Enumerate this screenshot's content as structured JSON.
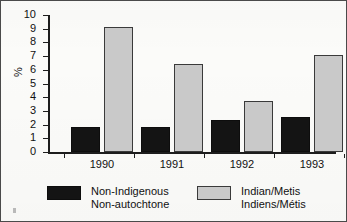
{
  "chart_data": {
    "type": "bar",
    "title": "",
    "xlabel": "",
    "ylabel": "%",
    "ylim": [
      0,
      10
    ],
    "ytick_step": 1,
    "grid": false,
    "legend_position": "bottom",
    "categories": [
      "1990",
      "1991",
      "1992",
      "1993"
    ],
    "ytick_labels": [
      "10",
      "9",
      "8",
      "7",
      "6",
      "5",
      "4",
      "3",
      "2",
      "1",
      "0"
    ],
    "series": [
      {
        "name": "Non-Indigenous",
        "name_fr": "Non-autochtone",
        "color": "#141414",
        "values": [
          1.8,
          1.85,
          2.35,
          2.55
        ]
      },
      {
        "name": "Indian/Metis",
        "name_fr": "Indiens/Métis",
        "color": "#c9c9c9",
        "values": [
          9.1,
          6.4,
          3.75,
          7.1
        ]
      }
    ]
  },
  "legend": {
    "entries": [
      {
        "line1": "Non-Indigenous",
        "line2": "Non-autochtone",
        "swatch": "dark"
      },
      {
        "line1": "Indian/Metis",
        "line2": "Indiens/Métis",
        "swatch": "light"
      }
    ]
  }
}
